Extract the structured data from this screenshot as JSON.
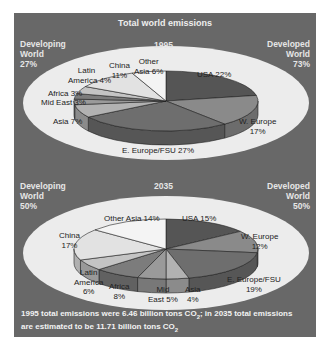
{
  "figure": {
    "title": "Total world emissions",
    "footer_line1": "1995 total emissions were 6.46 billion tons CO",
    "footer_line1_tail": "; in 2035 total emissions",
    "footer_line2": "are estimated to be 11.71 billion tons CO",
    "sub2": "2"
  },
  "chart_data": [
    {
      "type": "pie",
      "title": "1995",
      "developing": {
        "label_line1": "Developing",
        "label_line2": "World",
        "value": "27%"
      },
      "developed": {
        "label_line1": "Developed",
        "label_line2": "World",
        "value": "73%"
      },
      "categories": [
        "USA",
        "W. Europe",
        "E. Europe/FSU",
        "Asia",
        "Mid East",
        "Africa",
        "Latin America",
        "China",
        "Other Asia"
      ],
      "values": [
        22,
        17,
        27,
        7,
        3,
        3,
        4,
        11,
        6
      ],
      "labels": {
        "usa": "USA 22%",
        "weurope_1": "W. Europe",
        "weurope_2": "17%",
        "eeurope": "E. Europe/FSU 27%",
        "asia": "Asia 7%",
        "mideast": "Mid East 3%",
        "africa": "Africa 3%",
        "latin_1": "Latin",
        "latin_2": "America 4%",
        "china_1": "China",
        "china_2": "11%",
        "otherasia_1": "Other",
        "otherasia_2": "Asia 6%"
      }
    },
    {
      "type": "pie",
      "title": "2035",
      "developing": {
        "label_line1": "Developing",
        "label_line2": "World",
        "value": "50%"
      },
      "developed": {
        "label_line1": "Developed",
        "label_line2": "World",
        "value": "50%"
      },
      "categories": [
        "USA",
        "W. Europe",
        "E. Europe/FSU",
        "Asia",
        "Mid East",
        "Africa",
        "Latin America",
        "China",
        "Other Asia"
      ],
      "values": [
        15,
        12,
        19,
        4,
        5,
        8,
        6,
        17,
        14
      ],
      "labels": {
        "usa": "USA 15%",
        "weurope_1": "W. Europe",
        "weurope_2": "12%",
        "eeurope_1": "E. Europe/FSU",
        "eeurope_2": "19%",
        "asia_1": "Asia",
        "asia_2": "4%",
        "mideast_1": "Mid",
        "mideast_2": "East 5%",
        "africa_1": "Africa",
        "africa_2": "8%",
        "latin_1": "Latin",
        "latin_2": "America",
        "latin_3": "6%",
        "china_1": "China",
        "china_2": "17%",
        "otherasia": "Other Asia 14%"
      }
    }
  ],
  "colors": {
    "panel": "#686868",
    "ellipse": "#ececec",
    "usa": "#555555",
    "weurope": "#8a8a8a",
    "eeurope": "#6e6e6e",
    "asia": "#b2b2b2",
    "mideast": "#9a9a9a",
    "africa": "#7c7c7c",
    "latin": "#c4c4c4",
    "china": "#e2e2e2",
    "otherasia": "#f4f4f4"
  }
}
